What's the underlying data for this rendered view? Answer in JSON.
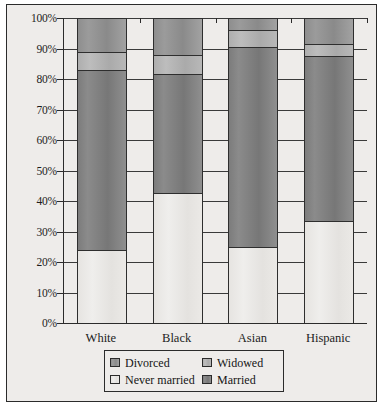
{
  "chart_data": {
    "type": "bar",
    "subtype": "stacked-bar-100-percent",
    "title": "",
    "xlabel": "",
    "ylabel": "",
    "ylim": [
      0,
      100
    ],
    "ytick_labels": [
      "0%",
      "10%",
      "20%",
      "30%",
      "40%",
      "50%",
      "60%",
      "70%",
      "80%",
      "90%",
      "100%"
    ],
    "ytick_values": [
      0,
      10,
      20,
      30,
      40,
      50,
      60,
      70,
      80,
      90,
      100
    ],
    "grid": true,
    "grid_axis": "y",
    "legend_position": "bottom",
    "categories": [
      "White",
      "Black",
      "Asian",
      "Hispanic"
    ],
    "series": [
      {
        "name": "Never married",
        "values": [
          24,
          42.5,
          25,
          33.5
        ],
        "color": "#e9e7e4"
      },
      {
        "name": "Married",
        "values": [
          59,
          39,
          65.5,
          54
        ],
        "color": "#828282"
      },
      {
        "name": "Widowed",
        "values": [
          6,
          6.5,
          5.5,
          4
        ],
        "color": "#b3b3b3"
      },
      {
        "name": "Divorced",
        "values": [
          11,
          12,
          4,
          8.5
        ],
        "color": "#949494"
      }
    ],
    "stack_order_bottom_to_top": [
      "Never married",
      "Married",
      "Widowed",
      "Divorced"
    ],
    "legend_entries": [
      {
        "label": "Divorced",
        "color": "#949494"
      },
      {
        "label": "Widowed",
        "color": "#b3b3b3"
      },
      {
        "label": "Never married",
        "color": "#e9e7e4"
      },
      {
        "label": "Married",
        "color": "#828282"
      }
    ],
    "colors": {
      "background": "#eeecea",
      "axis": "#2b2b2b",
      "gridline": "#3a3a3a",
      "text": "#1d1d1d"
    }
  }
}
